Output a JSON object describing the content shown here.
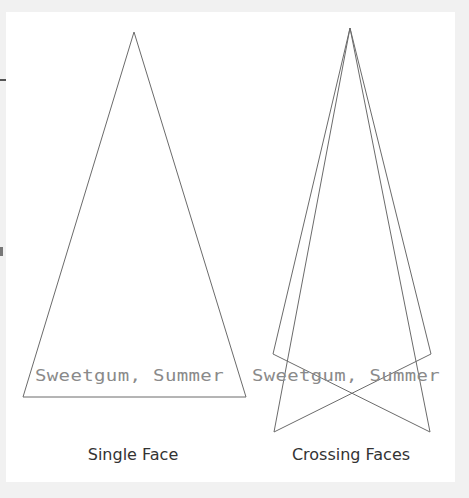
{
  "diagram": {
    "background_color": "#f1f1f1",
    "panel_color": "#ffffff",
    "stroke_color": "#6b6b6b",
    "label_color": "#8a8a8a",
    "caption_color": "#333333",
    "single_face": {
      "label": "Sweetgum, Summer",
      "caption": "Single Face",
      "triangle": [
        [
          134,
          32
        ],
        [
          23,
          397
        ],
        [
          246,
          397
        ]
      ]
    },
    "crossing_faces": {
      "label": "Sweetgum, Summer",
      "caption": "Crossing Faces",
      "face_a": [
        [
          350,
          28
        ],
        [
          273,
          354
        ],
        [
          430,
          432
        ]
      ],
      "face_b": [
        [
          350,
          28
        ],
        [
          431,
          354
        ],
        [
          274,
          432
        ]
      ]
    }
  }
}
